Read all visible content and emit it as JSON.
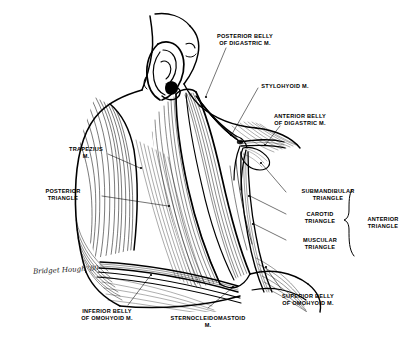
{
  "figure": {
    "signature": "Bridget Hough '80",
    "ink_color": "#000000",
    "paper_color": "#ffffff"
  },
  "labels": {
    "posterior_belly_digastric": "POSTERIOR BELLY\nOF DIGASTRIC M.",
    "stylohyoid": "STYLOHYOID M.",
    "anterior_belly_digastric": "ANTERIOR BELLY\nOF DIGASTRIC M.",
    "trapezius": "TRAPEZIUS\nM.",
    "posterior_triangle": "POSTERIOR\nTRIANGLE",
    "submandibular_triangle": "SUBMANDIBULAR\nTRIANGLE",
    "carotid_triangle": "CAROTID\nTRIANGLE",
    "muscular_triangle": "MUSCULAR\nTRIANGLE",
    "anterior_triangle": "ANTERIOR\nTRIANGLE",
    "inferior_belly_omohyoid": "INFERIOR BELLY\nOF OMOHYOID M.",
    "sternocleidomastoid": "STERNOCLEIDOMASTOID\nM.",
    "superior_belly_omohyoid": "SUPERIOR BELLY\nOF OMOHYOID M."
  }
}
